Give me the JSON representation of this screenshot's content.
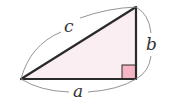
{
  "diagram": {
    "type": "right-triangle",
    "labels": {
      "hypotenuse": "c",
      "vertical_leg": "b",
      "horizontal_leg": "a"
    },
    "vertices": {
      "left": [
        21,
        79
      ],
      "right_angle": [
        136,
        79
      ],
      "top": [
        136,
        7
      ]
    },
    "colors": {
      "triangle_fill": "#fbeef2",
      "right_angle_fill": "#f5b5c2",
      "stroke": "#2a2a2a",
      "brace": "#888888",
      "label": "#333333"
    }
  }
}
